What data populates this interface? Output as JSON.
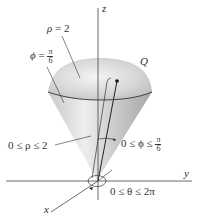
{
  "figure": {
    "type": "spherical-coordinates-cone-region",
    "region_label": "Q",
    "axes": {
      "z": "z",
      "y": "y",
      "x": "x"
    },
    "surface_labels": {
      "sphere": {
        "lhs": "ρ",
        "eq": "=",
        "rhs": "2"
      },
      "cone": {
        "lhs": "ϕ",
        "eq": "=",
        "num": "π",
        "den": "6"
      }
    },
    "bounds": {
      "rho": {
        "text": "0 ≤ ρ ≤ 2"
      },
      "phi": {
        "prefix": "0 ≤ ϕ ≤",
        "num": "π",
        "den": "6"
      },
      "theta": {
        "text": "0 ≤ θ ≤ 2π"
      }
    },
    "colors": {
      "axis": "#444444",
      "cone_fill_light": "#f2f2f2",
      "cone_fill_dark": "#a9a9a9",
      "text": "#333333"
    }
  }
}
